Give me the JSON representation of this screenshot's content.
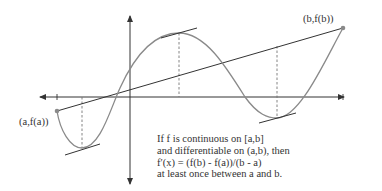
{
  "diagram": {
    "point_a_label": "(a,f(a))",
    "point_b_label": "(b,f(b))",
    "caption_lines": [
      "If f is continuous on [a,b]",
      "and differentiable on (a,b), then",
      "f′(x) = (f(b) - f(a))/(b - a)",
      "at least once between a and b."
    ],
    "colors": {
      "curve": "#8a8a8a",
      "lines": "#333333",
      "axes": "#333333",
      "dashed": "#777777",
      "text": "#333333"
    },
    "elements": [
      "x-axis",
      "y-axis",
      "curve-f",
      "secant-line",
      "tangent-line-left-min",
      "tangent-line-max",
      "tangent-line-right-min",
      "dashed-guide-left",
      "dashed-guide-middle",
      "dashed-guide-right",
      "endpoint-a",
      "endpoint-b",
      "tick-a",
      "tick-b"
    ]
  }
}
